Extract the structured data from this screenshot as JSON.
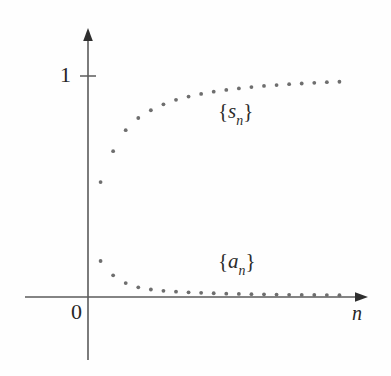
{
  "figure": {
    "name": "sequence-and-partial-sums-scatter",
    "background_color": "#fefefe",
    "axis_color": "#555555",
    "point_color": "#6e6e6e",
    "text_color": "#262626"
  },
  "axes": {
    "x_axis_name": "n",
    "origin_label": "0",
    "y_tick_label": "1",
    "y_tick_value": 1,
    "x_axis_pixel_y": 297,
    "y_axis_pixel_x": 88,
    "y_value_1_pixel_y": 76
  },
  "labels": {
    "series_sn": {
      "open": "{",
      "symbol": "s",
      "subscript": "n",
      "close": "}"
    },
    "series_an": {
      "open": "{",
      "symbol": "a",
      "subscript": "n",
      "close": "}"
    }
  },
  "chart_data": {
    "type": "scatter",
    "title": "",
    "xlabel": "n",
    "ylabel": "",
    "grid": false,
    "legend": "inline-annotations",
    "xlim": [
      0,
      21
    ],
    "ylim": [
      0,
      1.12
    ],
    "x": [
      1,
      2,
      3,
      4,
      5,
      6,
      7,
      8,
      9,
      10,
      11,
      12,
      13,
      14,
      15,
      16,
      17,
      18,
      19,
      20
    ],
    "series": [
      {
        "name": "{s_n}",
        "annotation": "{s_n}",
        "description": "partial sums increasing toward 1",
        "values": [
          0.52,
          0.66,
          0.755,
          0.81,
          0.845,
          0.872,
          0.892,
          0.907,
          0.919,
          0.929,
          0.937,
          0.944,
          0.95,
          0.955,
          0.959,
          0.963,
          0.966,
          0.969,
          0.972,
          0.974
        ]
      },
      {
        "name": "{a_n}",
        "annotation": "{a_n}",
        "description": "terms decreasing toward 0",
        "values": [
          0.163,
          0.098,
          0.063,
          0.044,
          0.034,
          0.028,
          0.024,
          0.021,
          0.019,
          0.017,
          0.015,
          0.014,
          0.013,
          0.012,
          0.011,
          0.01,
          0.0095,
          0.009,
          0.0085,
          0.008
        ]
      }
    ]
  }
}
